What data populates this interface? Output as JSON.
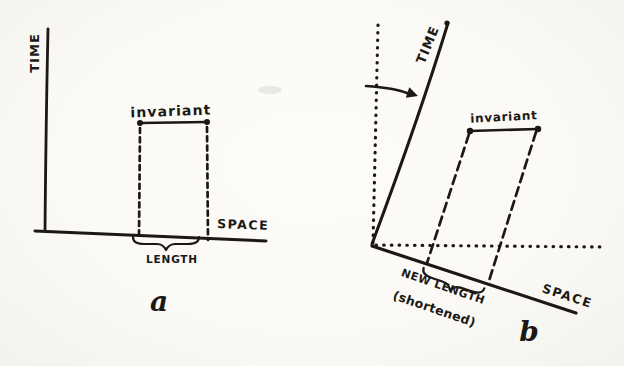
{
  "palette": {
    "paper": "#faf9f5",
    "ink": "#1b1815"
  },
  "figure": {
    "diagram_a": {
      "time_axis_label": "TIME",
      "space_axis_label": "SPACE",
      "invariant_label": "invariant",
      "length_label": "LENGTH",
      "caption": "a"
    },
    "diagram_b": {
      "time_axis_label": "TIME",
      "space_axis_label": "SPACE",
      "invariant_label": "invariant",
      "new_length_label": "NEW LENGTH",
      "shortened_label": "(shortened)",
      "caption": "b"
    }
  }
}
